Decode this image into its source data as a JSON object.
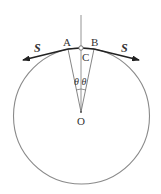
{
  "diagram": {
    "type": "physics-free-body",
    "labels": {
      "point_a": "A",
      "point_b": "B",
      "point_c": "C",
      "center_o": "O",
      "theta_left": "θ",
      "theta_right": "θ",
      "force_left": "S",
      "force_right": "S"
    },
    "colors": {
      "circle": "#8a8a8a",
      "lines": "#777777",
      "arrows": "#222222",
      "text": "#333333"
    }
  }
}
